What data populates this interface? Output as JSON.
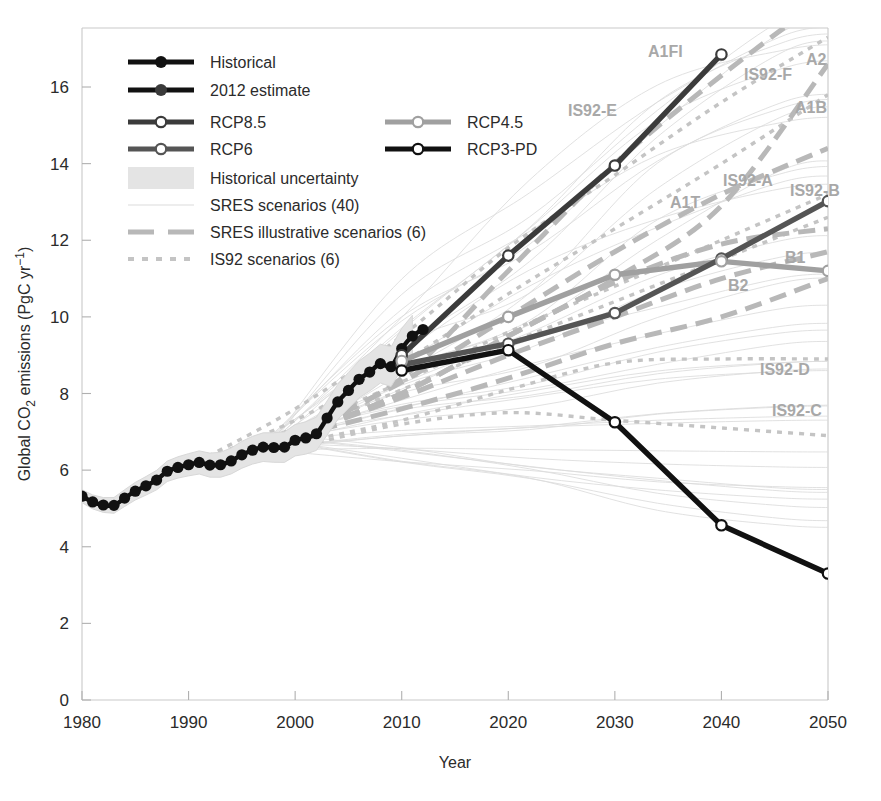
{
  "figure": {
    "width": 881,
    "height": 801
  },
  "axes": {
    "x_title": "Year",
    "y_title_parts": {
      "a": "Global CO",
      "sub": "2",
      "b": " emissions (PgC yr",
      "sup": "−1",
      "c": ")"
    },
    "x_ticks": [
      "1980",
      "1990",
      "2000",
      "2010",
      "2020",
      "2030",
      "2040",
      "2050"
    ],
    "y_ticks": [
      "0",
      "2",
      "4",
      "6",
      "8",
      "10",
      "12",
      "14",
      "16"
    ]
  },
  "legend": {
    "items": [
      {
        "label": "Historical",
        "style": "solid-black-filled-marker",
        "column": 1
      },
      {
        "label": "2012 estimate",
        "style": "solid-black-filled-marker",
        "column": 1
      },
      {
        "label": "RCP8.5",
        "style": "solid-dark-open-marker",
        "column": 1
      },
      {
        "label": "RCP4.5",
        "style": "solid-light-open-marker",
        "column": 2
      },
      {
        "label": "RCP6",
        "style": "solid-mid-open-marker",
        "column": 1
      },
      {
        "label": "RCP3-PD",
        "style": "solid-black-open-marker",
        "column": 2
      },
      {
        "label": "Historical uncertainty",
        "style": "shaded-band",
        "column": 1
      },
      {
        "label": "SRES scenarios (40)",
        "style": "thin-grey-line",
        "column": 1
      },
      {
        "label": "SRES illustrative scenarios (6)",
        "style": "dashed-grey-line",
        "column": 1
      },
      {
        "label": "IS92 scenarios (6)",
        "style": "dotted-grey-line",
        "column": 1
      }
    ]
  },
  "annotations": [
    {
      "text": "A1FI",
      "x": 648,
      "y": 57
    },
    {
      "text": "A2",
      "x": 806,
      "y": 65
    },
    {
      "text": "IS92-F",
      "x": 744,
      "y": 80
    },
    {
      "text": "IS92-E",
      "x": 568,
      "y": 116
    },
    {
      "text": "A1B",
      "x": 795,
      "y": 113
    },
    {
      "text": "IS92-A",
      "x": 723,
      "y": 186
    },
    {
      "text": "IS92-B",
      "x": 790,
      "y": 196
    },
    {
      "text": "A1T",
      "x": 670,
      "y": 208
    },
    {
      "text": "B1",
      "x": 785,
      "y": 263
    },
    {
      "text": "B2",
      "x": 728,
      "y": 291
    },
    {
      "text": "IS92-D",
      "x": 760,
      "y": 375
    },
    {
      "text": "IS92-C",
      "x": 772,
      "y": 416
    }
  ],
  "colors": {
    "historical": "#111111",
    "rcp85": "#3b3b3b",
    "rcp6": "#555555",
    "rcp45": "#a0a0a0",
    "rcp3pd": "#111111",
    "sres_thin": "#dcdcdc",
    "sres_dashed": "#b8b8b8",
    "is92_dotted": "#c4c4c4",
    "uncertainty_band": "#e4e4e4",
    "axis": "#c9c9c9",
    "text": "#2b2b2b",
    "annotation": "#a8a8a8"
  },
  "chart_data": {
    "type": "line",
    "title": "",
    "xlabel": "Year",
    "ylabel": "Global CO2 emissions (PgC yr-1)",
    "xlim": [
      1980,
      2050
    ],
    "ylim": [
      0,
      17.2
    ],
    "grid": false,
    "legend_position": "top-left-inside",
    "series": [
      {
        "name": "Historical",
        "style": "solid-black-filled-markers",
        "x": [
          1980,
          1981,
          1982,
          1983,
          1984,
          1985,
          1986,
          1987,
          1988,
          1989,
          1990,
          1991,
          1992,
          1993,
          1994,
          1995,
          1996,
          1997,
          1998,
          1999,
          2000,
          2001,
          2002,
          2003,
          2004,
          2005,
          2006,
          2007,
          2008,
          2009,
          2010,
          2011
        ],
        "values": [
          5.32,
          5.17,
          5.09,
          5.08,
          5.27,
          5.45,
          5.59,
          5.74,
          5.97,
          6.07,
          6.14,
          6.2,
          6.13,
          6.14,
          6.24,
          6.4,
          6.52,
          6.6,
          6.59,
          6.6,
          6.78,
          6.84,
          6.95,
          7.36,
          7.78,
          8.08,
          8.37,
          8.56,
          8.78,
          8.7,
          9.17,
          9.5
        ]
      },
      {
        "name": "2012 estimate",
        "style": "solid-black-filled-marker",
        "x": [
          2012
        ],
        "values": [
          9.67
        ]
      },
      {
        "name": "RCP8.5",
        "style": "solid-dark-open-markers",
        "x": [
          2010,
          2020,
          2030,
          2040
        ],
        "values": [
          9.0,
          11.6,
          13.95,
          16.85
        ]
      },
      {
        "name": "RCP6",
        "style": "solid-mid-open-markers",
        "x": [
          2010,
          2020,
          2030,
          2040,
          2050
        ],
        "values": [
          8.75,
          9.3,
          10.1,
          11.52,
          13.02
        ]
      },
      {
        "name": "RCP4.5",
        "style": "solid-light-open-markers",
        "x": [
          2010,
          2020,
          2030,
          2040,
          2050
        ],
        "values": [
          8.85,
          10.0,
          11.1,
          11.45,
          11.2
        ]
      },
      {
        "name": "RCP3-PD",
        "style": "solid-black-open-markers",
        "x": [
          2010,
          2020,
          2030,
          2040,
          2050
        ],
        "values": [
          8.6,
          9.13,
          7.25,
          4.56,
          3.3
        ]
      },
      {
        "name": "A1FI",
        "style": "dashed-grey",
        "x": [
          2000,
          2010,
          2020,
          2030,
          2040,
          2050
        ],
        "values": [
          6.9,
          8.4,
          11.2,
          14.0,
          16.3,
          18.4
        ]
      },
      {
        "name": "A2",
        "style": "dashed-grey",
        "x": [
          2000,
          2010,
          2020,
          2030,
          2040,
          2050
        ],
        "values": [
          6.9,
          8.0,
          9.5,
          11.0,
          12.9,
          16.6
        ]
      },
      {
        "name": "A1B",
        "style": "dashed-grey",
        "x": [
          2000,
          2010,
          2020,
          2030,
          2040,
          2050
        ],
        "values": [
          6.9,
          8.3,
          10.0,
          11.7,
          13.2,
          14.4
        ]
      },
      {
        "name": "A1T",
        "style": "dashed-grey",
        "x": [
          2000,
          2010,
          2020,
          2030,
          2040,
          2050
        ],
        "values": [
          6.9,
          8.0,
          9.5,
          10.9,
          11.9,
          12.3
        ]
      },
      {
        "name": "B1",
        "style": "dashed-grey",
        "x": [
          2000,
          2010,
          2020,
          2030,
          2040,
          2050
        ],
        "values": [
          6.9,
          7.9,
          9.0,
          10.0,
          11.0,
          11.7
        ]
      },
      {
        "name": "B2",
        "style": "dashed-grey",
        "x": [
          2000,
          2010,
          2020,
          2030,
          2040,
          2050
        ],
        "values": [
          6.9,
          7.6,
          8.4,
          9.3,
          10.0,
          11.0
        ]
      },
      {
        "name": "IS92-E",
        "style": "dotted-grey",
        "x": [
          1990,
          2000,
          2010,
          2020,
          2030,
          2040,
          2050
        ],
        "values": [
          6.1,
          7.6,
          9.5,
          11.8,
          13.7,
          15.6,
          17.3
        ]
      },
      {
        "name": "IS92-F",
        "style": "dotted-grey",
        "x": [
          1990,
          2000,
          2010,
          2020,
          2030,
          2040,
          2050
        ],
        "values": [
          6.1,
          7.3,
          8.8,
          10.6,
          12.3,
          14.0,
          15.8
        ]
      },
      {
        "name": "IS92-A",
        "style": "dotted-grey",
        "x": [
          1990,
          2000,
          2010,
          2020,
          2030,
          2040,
          2050
        ],
        "values": [
          6.1,
          7.1,
          8.3,
          9.6,
          10.8,
          12.0,
          13.2
        ]
      },
      {
        "name": "IS92-B",
        "style": "dotted-grey",
        "x": [
          1990,
          2000,
          2010,
          2020,
          2030,
          2040,
          2050
        ],
        "values": [
          6.1,
          7.0,
          8.1,
          9.3,
          10.4,
          11.5,
          12.6
        ]
      },
      {
        "name": "IS92-D",
        "style": "dotted-grey",
        "x": [
          1990,
          2000,
          2010,
          2020,
          2030,
          2040,
          2050
        ],
        "values": [
          6.1,
          6.7,
          7.3,
          8.1,
          8.8,
          8.9,
          8.9
        ]
      },
      {
        "name": "IS92-C",
        "style": "dotted-grey",
        "x": [
          1990,
          2000,
          2010,
          2020,
          2030,
          2040,
          2050
        ],
        "values": [
          6.1,
          6.6,
          7.2,
          7.5,
          7.3,
          7.1,
          6.9
        ]
      }
    ],
    "sres_ensemble_count": 40,
    "sres_illustrative_count": 6,
    "is92_count": 6
  }
}
